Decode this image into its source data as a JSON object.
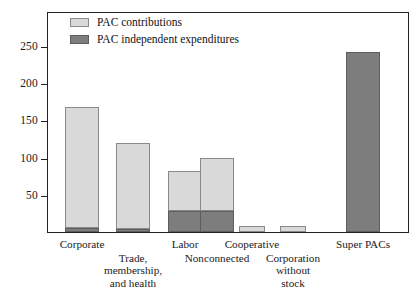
{
  "chart_data": {
    "type": "bar",
    "subtype": "stacked-bar",
    "title": "",
    "xlabel": "",
    "ylabel": "",
    "ylim": [
      0,
      270
    ],
    "yticks": [
      50,
      100,
      150,
      200,
      250
    ],
    "ytick_labels": [
      "50",
      "100",
      "150",
      "200",
      "250"
    ],
    "grid": false,
    "legend_position": "top-left",
    "categories": [
      "Corporate",
      "Trade, membership, and health",
      "Labor",
      "Nonconnected",
      "Cooperative",
      "Corporation without stock",
      "Super PACs"
    ],
    "series": [
      {
        "name": "PAC contributions",
        "color": "#d9d9d9",
        "values": [
          163,
          115,
          54,
          71,
          8,
          8,
          0
        ]
      },
      {
        "name": "PAC independent expenditures",
        "color": "#7d7d7d",
        "values": [
          5,
          4,
          28,
          28,
          0,
          0,
          242
        ]
      }
    ],
    "totals": [
      168,
      119,
      82,
      99,
      8,
      8,
      242
    ]
  },
  "legend": {
    "items": [
      {
        "label": "PAC contributions",
        "swatch": "light"
      },
      {
        "label": "PAC independent expenditures",
        "swatch": "dark"
      }
    ]
  },
  "axis": {
    "y_tick_labels": [
      "250",
      "200",
      "150",
      "100",
      "50"
    ]
  },
  "x_categories": [
    {
      "lines": [
        "Corporate"
      ],
      "row": 0
    },
    {
      "lines": [
        "Trade,",
        "membership,",
        "and health"
      ],
      "row": 1
    },
    {
      "lines": [
        "Labor"
      ],
      "row": 0
    },
    {
      "lines": [
        "Nonconnected"
      ],
      "row": 1
    },
    {
      "lines": [
        "Cooperative"
      ],
      "row": 0
    },
    {
      "lines": [
        "Corporation",
        "without",
        "stock"
      ],
      "row": 1
    },
    {
      "lines": [
        "Super PACs"
      ],
      "row": 0
    }
  ]
}
